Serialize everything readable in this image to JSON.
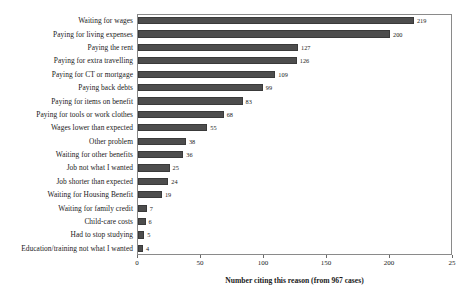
{
  "chart_data": {
    "type": "bar",
    "orientation": "horizontal",
    "title": "",
    "xlabel": "Number citing this reason (from 967 cases)",
    "ylabel": "Problems encountered",
    "xlim": [
      0,
      250
    ],
    "xticks": [
      0,
      50,
      100,
      150,
      200,
      250
    ],
    "xtick_labels": [
      "0",
      "50",
      "100",
      "150",
      "200",
      "25"
    ],
    "grid": false,
    "legend": null,
    "bar_color": "#4d4d4d",
    "show_values": true,
    "categories": [
      "Waiting for wages",
      "Paying for living expenses",
      "Paying the rent",
      "Paying for extra travelling",
      "Paying for CT or mortgage",
      "Paying back debts",
      "Paying for items on benefit",
      "Paying for tools or work clothes",
      "Wages lower than expected",
      "Other problem",
      "Waiting for other benefits",
      "Job not what I wanted",
      "Job shorter than expected",
      "Waiting for Housing Benefit",
      "Waiting for family credit",
      "Child-care costs",
      "Had to stop studying",
      "Education/training not what I wanted"
    ],
    "values": [
      219,
      200,
      127,
      126,
      109,
      99,
      83,
      68,
      55,
      38,
      36,
      25,
      24,
      19,
      7,
      6,
      5,
      4
    ]
  }
}
